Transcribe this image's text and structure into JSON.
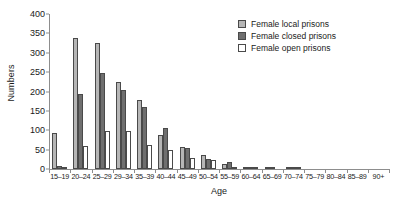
{
  "chart_data": {
    "type": "bar",
    "title": "",
    "xlabel": "Age",
    "ylabel": "Numbers",
    "ylim": [
      0,
      400
    ],
    "yticks": [
      0,
      50,
      100,
      150,
      200,
      250,
      300,
      350,
      400
    ],
    "grid": false,
    "legend_position": "top-right",
    "categories": [
      "15–19",
      "20–24",
      "25–29",
      "29–34",
      "35–39",
      "40–44",
      "45–49",
      "50–54",
      "55–59",
      "60–64",
      "65–69",
      "70–74",
      "75–79",
      "80–84",
      "85–89",
      "90+"
    ],
    "series": [
      {
        "name": "Female local prisons",
        "color": "#b6b6b6",
        "values": [
          92,
          337,
          325,
          225,
          177,
          87,
          57,
          35,
          13,
          4,
          2,
          3,
          0,
          0,
          0,
          0
        ]
      },
      {
        "name": "Female closed prisons",
        "color": "#6f6f6f",
        "values": [
          9,
          193,
          248,
          203,
          159,
          107,
          53,
          26,
          18,
          4,
          2,
          2,
          0,
          0,
          0,
          0
        ]
      },
      {
        "name": "Female open prisons",
        "color": "#ffffff",
        "values": [
          3,
          60,
          97,
          97,
          62,
          50,
          28,
          23,
          3,
          3,
          0,
          1,
          0,
          0,
          0,
          0
        ]
      }
    ]
  }
}
